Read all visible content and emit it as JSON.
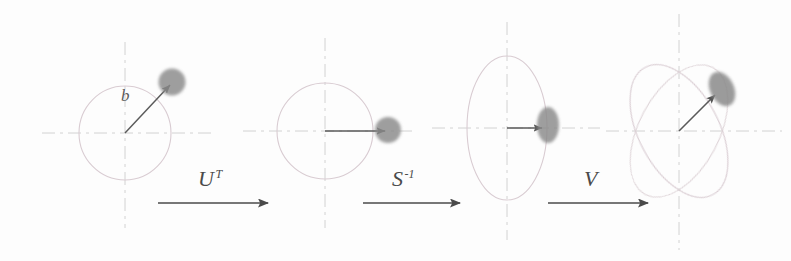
{
  "figure": {
    "background_color": "#fdfdfd",
    "axis_color": "#cfcfcf",
    "shape_outline_color": "#d4c7cc",
    "blob_color": "#8a8a8a",
    "arrow_color": "#4a4a4a",
    "label_color": "#4a4a4a"
  },
  "panels": [
    {
      "id": "panel-1",
      "shape": "circle",
      "center": [
        125,
        133
      ],
      "radius_x": 46,
      "radius_y": 47,
      "rotation": 0,
      "vector_label": "b",
      "vector_tip": [
        170,
        85
      ],
      "blob": {
        "cx": 172,
        "cy": 82,
        "rx": 14,
        "ry": 14,
        "rotation": 0
      }
    },
    {
      "id": "panel-2",
      "shape": "circle",
      "center": [
        325,
        131
      ],
      "radius_x": 48,
      "radius_y": 48,
      "rotation": 0,
      "vector_label": "",
      "vector_tip": [
        385,
        131
      ],
      "blob": {
        "cx": 388,
        "cy": 130,
        "rx": 13,
        "ry": 13,
        "rotation": 0
      }
    },
    {
      "id": "panel-3",
      "shape": "ellipse",
      "center": [
        507,
        128
      ],
      "radius_x": 40,
      "radius_y": 72,
      "rotation": 0,
      "vector_label": "",
      "vector_tip": [
        544,
        128
      ],
      "blob": {
        "cx": 548,
        "cy": 125,
        "rx": 11,
        "ry": 18,
        "rotation": 0
      }
    },
    {
      "id": "panel-4",
      "shape": "ellipse-rotated",
      "center": [
        679,
        131
      ],
      "radius_x": 40,
      "radius_y": 72,
      "rotation": -28,
      "rotation_secondary": 28,
      "vector_label": "",
      "vector_tip": [
        718,
        92
      ],
      "blob": {
        "cx": 722,
        "cy": 89,
        "rx": 12,
        "ry": 18,
        "rotation": -25
      }
    }
  ],
  "operations": [
    {
      "id": "op-u-transpose",
      "base": "U",
      "superscript": "T",
      "label_x": 198,
      "label_y": 166,
      "arrow_x1": 158,
      "arrow_x2": 268,
      "arrow_y": 203
    },
    {
      "id": "op-s-inverse",
      "base": "S",
      "superscript": "-1",
      "label_x": 392,
      "label_y": 166,
      "arrow_x1": 363,
      "arrow_x2": 460,
      "arrow_y": 203
    },
    {
      "id": "op-v",
      "base": "V",
      "superscript": "",
      "label_x": 584,
      "label_y": 166,
      "arrow_x1": 548,
      "arrow_x2": 648,
      "arrow_y": 203
    }
  ]
}
